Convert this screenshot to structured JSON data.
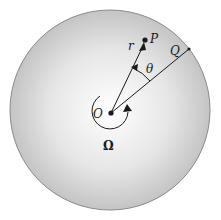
{
  "diagram": {
    "type": "rotating-disk",
    "disk": {
      "fill_center": "#ffffff",
      "fill_edge": "#bdbdbd",
      "stroke": "#888888"
    },
    "labels": {
      "origin": "O",
      "point_p": "P",
      "point_q": "Q",
      "radius": "r",
      "angle": "θ",
      "angular_velocity": "Ω"
    },
    "colors": {
      "ink": "#1a1a1a"
    }
  }
}
